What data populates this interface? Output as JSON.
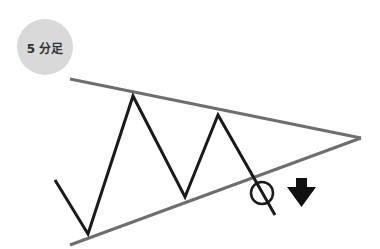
{
  "badge": {
    "label": "5 分足"
  },
  "colors": {
    "trendline": "#6e6e6e",
    "price": "#1a1a1a",
    "badge_bg": "#d9d9d9",
    "arrow": "#111111"
  },
  "diagram": {
    "type": "symmetrical-triangle-breakdown",
    "upper_trendline": [
      [
        70,
        79
      ],
      [
        361,
        138
      ]
    ],
    "lower_trendline": [
      [
        70,
        245
      ],
      [
        361,
        138
      ]
    ],
    "price_path": [
      [
        55,
        180
      ],
      [
        88,
        234
      ],
      [
        133,
        96
      ],
      [
        185,
        197
      ],
      [
        218,
        115
      ],
      [
        275,
        215
      ]
    ],
    "breakout_marker": {
      "cx": 262,
      "cy": 193,
      "r": 11
    },
    "direction_arrow": "down"
  }
}
